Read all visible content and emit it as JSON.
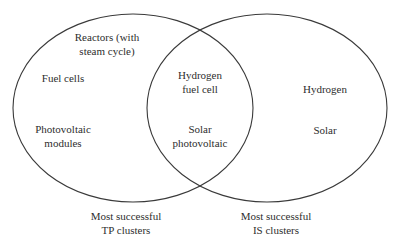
{
  "diagram": {
    "type": "venn",
    "stroke_color": "#3a3a3a",
    "sets": [
      {
        "id": "tp",
        "caption_line1": "Most successful",
        "caption_line2": "TP clusters",
        "exclusive_items": [
          {
            "line1": "Reactors (with",
            "line2": "steam cycle)"
          },
          {
            "line1": "Fuel cells",
            "line2": ""
          },
          {
            "line1": "Photovoltaic",
            "line2": "modules"
          }
        ]
      },
      {
        "id": "is",
        "caption_line1": "Most successful",
        "caption_line2": "IS clusters",
        "exclusive_items": [
          {
            "line1": "Hydrogen",
            "line2": ""
          },
          {
            "line1": "Solar",
            "line2": ""
          }
        ]
      }
    ],
    "intersection_items": [
      {
        "line1": "Hydrogen",
        "line2": "fuel cell"
      },
      {
        "line1": "Solar",
        "line2": "photovoltaic"
      }
    ]
  }
}
